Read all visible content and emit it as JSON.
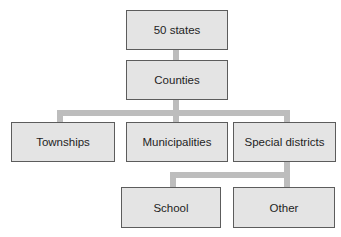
{
  "diagram": {
    "type": "hierarchy",
    "nodes": {
      "states": "50 states",
      "counties": "Counties",
      "townships": "Townships",
      "municipalities": "Municipalities",
      "special_districts": "Special districts",
      "school": "School",
      "other": "Other"
    },
    "edges": [
      [
        "50 states",
        "Counties"
      ],
      [
        "Counties",
        "Townships"
      ],
      [
        "Counties",
        "Municipalities"
      ],
      [
        "Counties",
        "Special districts"
      ],
      [
        "Special districts",
        "School"
      ],
      [
        "Special districts",
        "Other"
      ]
    ],
    "colors": {
      "box_fill": "#e4e4e4",
      "box_border": "#5c5c5c",
      "connector": "#bdbdbd"
    }
  }
}
